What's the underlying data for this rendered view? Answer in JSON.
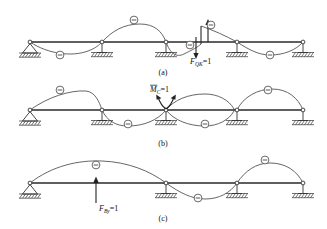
{
  "figure": {
    "background": "#ffffff",
    "ink": "#222222",
    "panels": [
      {
        "id": "a",
        "caption": "(a)",
        "load_label": {
          "symbol": "F",
          "subscript": "QK",
          "equation": "=1"
        },
        "load_label_text": "F_QK =1",
        "description": "Influence line for shear force at section K",
        "baseline_y": 42,
        "signs": [
          {
            "text": "−",
            "x": 60,
            "y": 55
          },
          {
            "text": "−",
            "x": 134,
            "y": 20
          },
          {
            "text": "−",
            "x": 190,
            "y": 45
          },
          {
            "text": "−",
            "x": 211,
            "y": 25
          },
          {
            "text": "−",
            "x": 270,
            "y": 55
          }
        ]
      },
      {
        "id": "b",
        "caption": "(b)",
        "load_label": {
          "symbol": "M",
          "subscript": "C",
          "equation": "=1",
          "overbar": true
        },
        "load_label_text": "M̄_C =1",
        "description": "Influence line for bending moment at section C",
        "baseline_y": 110,
        "signs": [
          {
            "text": "−",
            "x": 60,
            "y": 90
          },
          {
            "text": "−",
            "x": 128,
            "y": 124
          },
          {
            "text": "−",
            "x": 205,
            "y": 124
          },
          {
            "text": "−",
            "x": 268,
            "y": 90
          }
        ]
      },
      {
        "id": "c",
        "caption": "(c)",
        "load_label": {
          "symbol": "F",
          "subscript": "By",
          "equation": "=1"
        },
        "load_label_text": "F_By =1",
        "description": "Influence line for reaction at support B",
        "baseline_y": 183,
        "signs": [
          {
            "text": "−",
            "x": 96,
            "y": 165
          },
          {
            "text": "−",
            "x": 198,
            "y": 198
          },
          {
            "text": "−",
            "x": 265,
            "y": 160
          }
        ]
      }
    ],
    "supports": {
      "positions": [
        30,
        102,
        166,
        237,
        303
      ],
      "types": [
        "pin",
        "roller",
        "roller",
        "roller",
        "roller"
      ]
    }
  }
}
